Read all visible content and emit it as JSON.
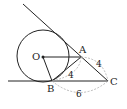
{
  "diagram": {
    "points": {
      "O": {
        "label": "O",
        "x": 43,
        "y": 57
      },
      "A": {
        "label": "A",
        "x": 81,
        "y": 57
      },
      "B": {
        "label": "B",
        "x": 52,
        "y": 81
      },
      "C": {
        "label": "C",
        "x": 108,
        "y": 81
      }
    },
    "circle": {
      "cx": 43,
      "cy": 56,
      "r": 26
    },
    "lengths": {
      "AB": "4",
      "AC": "4",
      "BC": "6"
    },
    "colors": {
      "line": "#222222",
      "dashed": "#aaaaaa"
    }
  }
}
